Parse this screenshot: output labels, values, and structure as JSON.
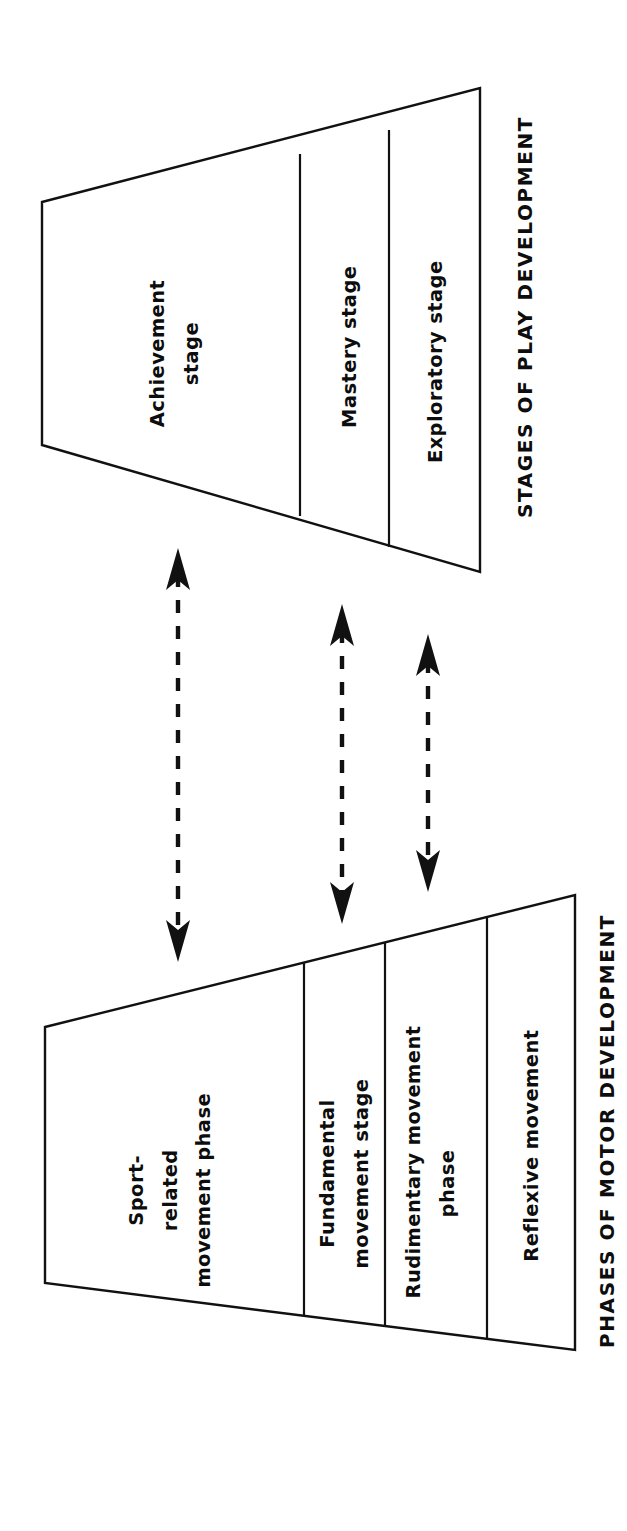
{
  "figure": {
    "title": "",
    "background_color": "#ffffff",
    "line_color": "#111111",
    "text_color": "#0d0d0d"
  },
  "play_development": {
    "caption": "STAGES OF PLAY DEVELOPMENT",
    "cells": [
      {
        "label": "Achievement\nstage"
      },
      {
        "label": "Mastery stage"
      },
      {
        "label": "Exploratory stage"
      }
    ]
  },
  "motor_development": {
    "caption": "PHASES OF MOTOR DEVELOPMENT",
    "cells": [
      {
        "label": "Sport-\nrelated\nmovement phase"
      },
      {
        "label": "Fundamental\nmovement stage"
      },
      {
        "label": "Rudimentary movement\nphase"
      },
      {
        "label": "Reflexive movement"
      }
    ]
  },
  "connectors": [
    {
      "name": "achievement-to-sport-related",
      "style": "dashed",
      "heads": "both"
    },
    {
      "name": "mastery-to-fundamental",
      "style": "dashed",
      "heads": "both"
    },
    {
      "name": "exploratory-to-rudimentary",
      "style": "dashed",
      "heads": "both"
    }
  ]
}
